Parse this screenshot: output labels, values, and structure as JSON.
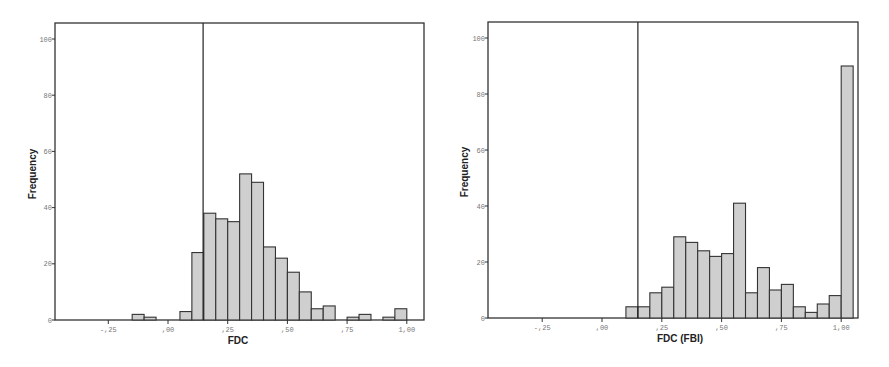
{
  "chart_data": [
    {
      "type": "bar",
      "title": "",
      "xlabel": "FDC",
      "ylabel": "Frequency",
      "xlim": [
        -0.45,
        1.07
      ],
      "ylim": [
        0,
        105
      ],
      "x_ticks": [
        "-,25",
        ",00",
        ",25",
        ",50",
        ",75",
        "1,00"
      ],
      "y_ticks": [
        "0",
        "20",
        "40",
        "60",
        "80",
        "100"
      ],
      "bin_width": 0.05,
      "reference_line_x": 0.147,
      "categories": [
        "-0.15",
        "-0.10",
        "0.05",
        "0.10",
        "0.15",
        "0.20",
        "0.25",
        "0.30",
        "0.35",
        "0.40",
        "0.45",
        "0.50",
        "0.55",
        "0.60",
        "0.65",
        "0.75",
        "0.80",
        "0.90",
        "0.95"
      ],
      "values": [
        2,
        1,
        3,
        24,
        38,
        36,
        35,
        52,
        49,
        26,
        22,
        17,
        10,
        4,
        5,
        1,
        2,
        1,
        4
      ]
    },
    {
      "type": "bar",
      "title": "",
      "xlabel": "FDC (FBI)",
      "ylabel": "Frequency",
      "xlim": [
        -0.45,
        1.07
      ],
      "ylim": [
        0,
        105
      ],
      "x_ticks": [
        "-,25",
        ",00",
        ",25",
        ",50",
        ",75",
        "1,00"
      ],
      "y_ticks": [
        "0",
        "20",
        "40",
        "60",
        "80",
        "100"
      ],
      "bin_width": 0.05,
      "reference_line_x": 0.15,
      "categories": [
        "0.10",
        "0.15",
        "0.20",
        "0.25",
        "0.30",
        "0.35",
        "0.40",
        "0.45",
        "0.50",
        "0.55",
        "0.60",
        "0.65",
        "0.70",
        "0.75",
        "0.80",
        "0.85",
        "0.90",
        "0.95",
        "1.00"
      ],
      "values": [
        4,
        4,
        9,
        11,
        29,
        27,
        24,
        22,
        23,
        41,
        9,
        18,
        10,
        12,
        4,
        2,
        5,
        8,
        90
      ]
    }
  ]
}
